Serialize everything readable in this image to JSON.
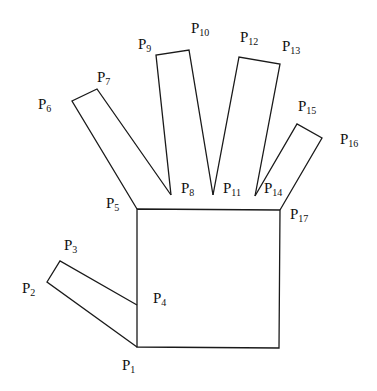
{
  "diagram": {
    "title": "",
    "stroke_color": "#1a1a1a",
    "points": [
      {
        "id": "P1",
        "label": "P",
        "sub": "1",
        "x": 137,
        "y": 347,
        "lx": 122,
        "ly": 370
      },
      {
        "id": "P2",
        "label": "P",
        "sub": "2",
        "x": 47,
        "y": 282,
        "lx": 22,
        "ly": 293
      },
      {
        "id": "P3",
        "label": "P",
        "sub": "3",
        "x": 60,
        "y": 261,
        "lx": 64,
        "ly": 250
      },
      {
        "id": "P4",
        "label": "P",
        "sub": "4",
        "x": 137,
        "y": 305,
        "lx": 153,
        "ly": 303
      },
      {
        "id": "P5",
        "label": "P",
        "sub": "5",
        "x": 137,
        "y": 209,
        "lx": 106,
        "ly": 208
      },
      {
        "id": "P6",
        "label": "P",
        "sub": "6",
        "x": 72,
        "y": 101,
        "lx": 38,
        "ly": 109
      },
      {
        "id": "P7",
        "label": "P",
        "sub": "7",
        "x": 97,
        "y": 89,
        "lx": 97,
        "ly": 82
      },
      {
        "id": "P8",
        "label": "P",
        "sub": "8",
        "x": 171,
        "y": 195,
        "lx": 181,
        "ly": 193
      },
      {
        "id": "P9",
        "label": "P",
        "sub": "9",
        "x": 156,
        "y": 55,
        "lx": 138,
        "ly": 49
      },
      {
        "id": "P10",
        "label": "P",
        "sub": "10",
        "x": 189,
        "y": 50,
        "lx": 191,
        "ly": 33
      },
      {
        "id": "P11",
        "label": "P",
        "sub": "11",
        "x": 213,
        "y": 195,
        "lx": 223,
        "ly": 193
      },
      {
        "id": "P12",
        "label": "P",
        "sub": "12",
        "x": 239,
        "y": 57,
        "lx": 240,
        "ly": 42
      },
      {
        "id": "P13",
        "label": "P",
        "sub": "13",
        "x": 280,
        "y": 64,
        "lx": 282,
        "ly": 51
      },
      {
        "id": "P14",
        "label": "P",
        "sub": "14",
        "x": 255,
        "y": 196,
        "lx": 264,
        "ly": 193
      },
      {
        "id": "P15",
        "label": "P",
        "sub": "15",
        "x": 297,
        "y": 124,
        "lx": 298,
        "ly": 111
      },
      {
        "id": "P16",
        "label": "P",
        "sub": "16",
        "x": 322,
        "y": 138,
        "lx": 340,
        "ly": 144
      },
      {
        "id": "P17",
        "label": "P",
        "sub": "17",
        "x": 280,
        "y": 210,
        "lx": 290,
        "ly": 219
      }
    ],
    "palm": [
      [
        137,
        209
      ],
      [
        280,
        210
      ],
      [
        279,
        348
      ],
      [
        137,
        347
      ]
    ],
    "thumb": [
      [
        137,
        347
      ],
      [
        47,
        282
      ],
      [
        60,
        261
      ],
      [
        137,
        305
      ]
    ],
    "fingers": [
      [
        [
          137,
          209
        ],
        [
          72,
          101
        ],
        [
          97,
          89
        ],
        [
          171,
          195
        ]
      ],
      [
        [
          171,
          195
        ],
        [
          156,
          55
        ],
        [
          189,
          50
        ],
        [
          213,
          195
        ]
      ],
      [
        [
          213,
          195
        ],
        [
          239,
          57
        ],
        [
          280,
          64
        ],
        [
          255,
          196
        ]
      ],
      [
        [
          255,
          196
        ],
        [
          297,
          124
        ],
        [
          322,
          138
        ],
        [
          280,
          210
        ]
      ]
    ]
  }
}
